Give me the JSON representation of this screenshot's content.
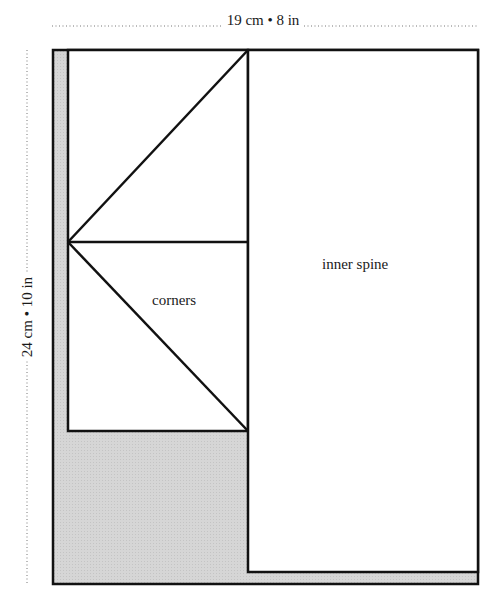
{
  "diagram": {
    "dimensions": {
      "width_label": "19 cm • 8 in",
      "height_label": "24 cm • 10 in"
    },
    "labels": {
      "corners": "corners",
      "inner_spine": "inner spine"
    },
    "colors": {
      "stroke": "#111111",
      "shaded": "#d4d4d4",
      "paper": "#ffffff",
      "dotted": "#777777"
    }
  }
}
